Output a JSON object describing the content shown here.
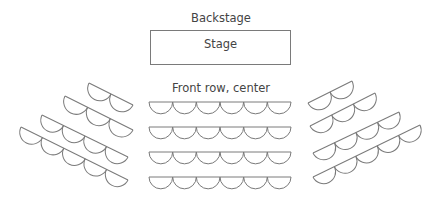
{
  "labels": {
    "backstage": "Backstage",
    "stage": "Stage",
    "front_row": "Front row, center"
  },
  "colors": {
    "stroke": "#7a7a7a",
    "text": "#444444",
    "background": "#ffffff"
  },
  "layout": {
    "backstage_label": {
      "x": 221,
      "y": 13
    },
    "stage_box": {
      "x": 150,
      "y": 30,
      "w": 141,
      "h": 35
    },
    "front_row_label": {
      "x": 221,
      "y": 83
    }
  },
  "seating": {
    "seat_width": 23.7,
    "center": {
      "seats_per_row": 6,
      "rows": [
        {
          "x1": 149,
          "y1": 102,
          "x2": 291,
          "y2": 102
        },
        {
          "x1": 149,
          "y1": 127,
          "x2": 291,
          "y2": 127
        },
        {
          "x1": 149,
          "y1": 152,
          "x2": 291,
          "y2": 152
        },
        {
          "x1": 149,
          "y1": 177,
          "x2": 291,
          "y2": 177
        }
      ]
    },
    "left": {
      "rows": [
        {
          "seats": 2,
          "x1": 89,
          "y1": 83,
          "x2": 133,
          "y2": 105
        },
        {
          "seats": 3,
          "x1": 65,
          "y1": 96,
          "x2": 133,
          "y2": 130
        },
        {
          "seats": 4,
          "x1": 42,
          "y1": 115,
          "x2": 128,
          "y2": 157
        },
        {
          "seats": 5,
          "x1": 21,
          "y1": 127,
          "x2": 128,
          "y2": 180
        }
      ]
    },
    "right": {
      "rows": [
        {
          "seats": 2,
          "x1": 308,
          "y1": 103,
          "x2": 352,
          "y2": 81
        },
        {
          "seats": 3,
          "x1": 310,
          "y1": 126,
          "x2": 375,
          "y2": 93
        },
        {
          "seats": 4,
          "x1": 313,
          "y1": 153,
          "x2": 399,
          "y2": 112
        },
        {
          "seats": 5,
          "x1": 313,
          "y1": 177,
          "x2": 420,
          "y2": 125
        }
      ]
    }
  }
}
